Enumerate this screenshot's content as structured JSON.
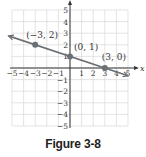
{
  "figure": {
    "caption": "Figure 3-8"
  },
  "colors": {
    "grid": "#d9d9d9",
    "axis": "#333333",
    "line": "#6b7075",
    "point": "#6b7075"
  },
  "chart_data": {
    "type": "line",
    "title": "",
    "xlabel": "x",
    "ylabel": "y",
    "xlim": [
      -5,
      5
    ],
    "ylim": [
      -5,
      5
    ],
    "grid": true,
    "x_ticks": [
      "−5",
      "−4",
      "−3",
      "−2",
      "−1",
      "1",
      "2",
      "3",
      "4",
      "5"
    ],
    "y_ticks": [
      "5",
      "4",
      "3",
      "2",
      "1",
      "−1",
      "−2",
      "−3",
      "−4",
      "−5"
    ],
    "series": [
      {
        "name": "line",
        "equation": "y = -x/3 + 1",
        "x": [
          -5.3,
          5
        ],
        "y": [
          2.77,
          -0.67
        ]
      }
    ],
    "points": [
      {
        "x": -3,
        "y": 2,
        "label": "(−3, 2)"
      },
      {
        "x": 0,
        "y": 1,
        "label": "(0, 1)"
      },
      {
        "x": 3,
        "y": 0,
        "label": "(3, 0)"
      }
    ]
  }
}
